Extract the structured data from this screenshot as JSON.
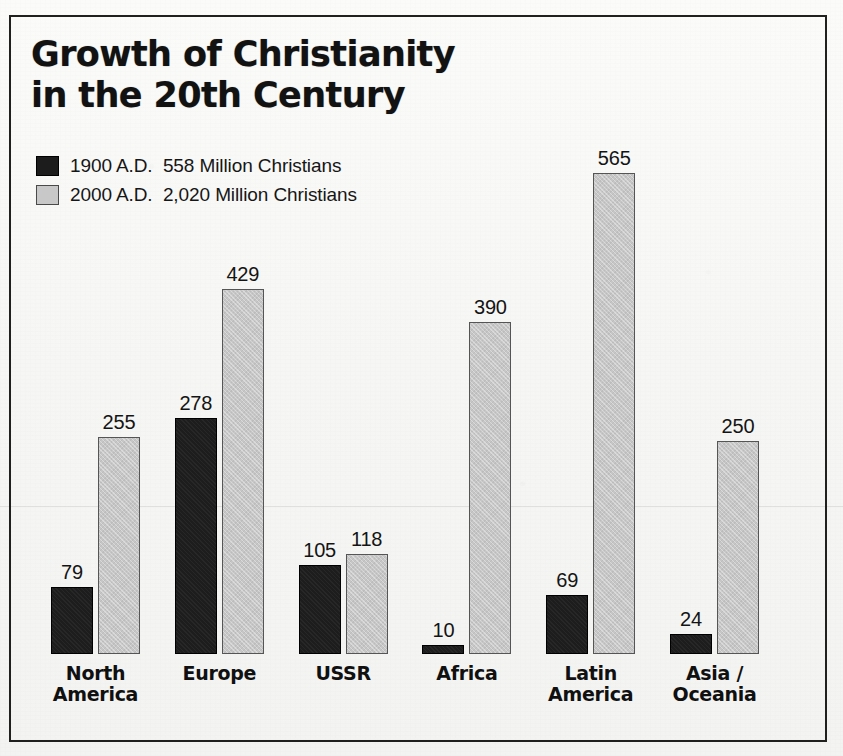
{
  "title": "Growth of Christianity\nin the 20th Century",
  "legend": [
    {
      "key": "dark",
      "swatch_color": "#1c1c1c",
      "label": "1900 A.D.  558 Million Christians"
    },
    {
      "key": "light",
      "swatch_color": "#c8c8c8",
      "label": "2000 A.D.  2,020 Million Christians"
    }
  ],
  "colors": {
    "series_1900": "#1d1d1d",
    "series_2000": "#c6c6c6",
    "frame": "#20201f",
    "paper": "#f6f6f4",
    "text": "#141414"
  },
  "chart_data": {
    "type": "bar",
    "title": "Growth of Christianity in the 20th Century",
    "xlabel": "",
    "ylabel": "",
    "ylim": [
      0,
      565
    ],
    "grid": false,
    "legend_position": "top-left",
    "value_labels": true,
    "categories": [
      "North America",
      "Europe",
      "USSR",
      "Africa",
      "Latin America",
      "Asia / Oceania"
    ],
    "category_labels": [
      "North\nAmerica",
      "Europe",
      "USSR",
      "Africa",
      "Latin\nAmerica",
      "Asia /\nOceania"
    ],
    "series": [
      {
        "name": "1900 A.D.",
        "unit": "Million Christians",
        "total": 558,
        "values": [
          79,
          278,
          105,
          10,
          69,
          24
        ]
      },
      {
        "name": "2000 A.D.",
        "unit": "Million Christians",
        "total": 2020,
        "values": [
          255,
          429,
          118,
          390,
          565,
          250
        ]
      }
    ]
  }
}
